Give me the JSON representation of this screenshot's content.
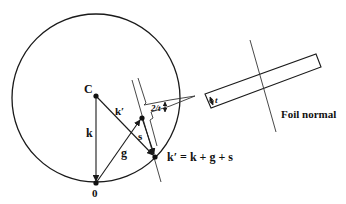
{
  "diagram": {
    "colors": {
      "stroke": "#1a1a1a",
      "background": "#ffffff"
    },
    "points": {
      "center": {
        "label": "C"
      },
      "origin": {
        "label": "0"
      }
    },
    "vectors": {
      "k": {
        "label": "k"
      },
      "k_prime": {
        "label": "k′"
      },
      "g": {
        "label": "g"
      },
      "s": {
        "label": "s"
      }
    },
    "relrod": {
      "width_label": "2/t"
    },
    "equation": "k′ = k + g + s",
    "foil": {
      "thickness_label": "t",
      "normal_label": "Foil normal"
    }
  }
}
